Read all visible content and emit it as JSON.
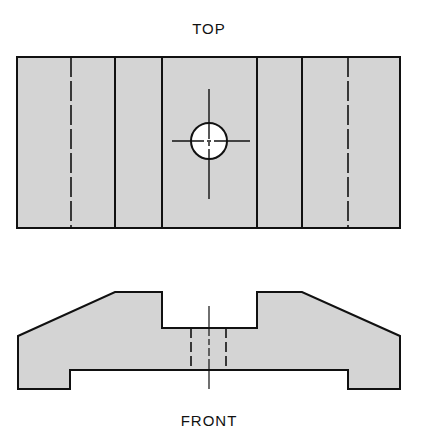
{
  "views": {
    "top": {
      "label": "TOP"
    },
    "front": {
      "label": "FRONT"
    }
  },
  "colors": {
    "fill": "#d4d4d4",
    "stroke": "#111111",
    "hole_fill": "#ffffff",
    "background": "#ffffff"
  },
  "geometry": {
    "top_view": {
      "outline": {
        "x": 17,
        "y": 57,
        "width": 383,
        "height": 171
      },
      "solid_lines_x": [
        115,
        162,
        257,
        302
      ],
      "hidden_lines_x": [
        71,
        348
      ],
      "hole": {
        "cx": 209,
        "cy": 141,
        "r": 18
      },
      "centerline_vertical": {
        "x": 209,
        "y1": 89,
        "y2": 199
      },
      "centerline_horizontal": {
        "y": 141,
        "x1": 172,
        "x2": 250
      }
    },
    "front_view": {
      "outline_points": "18,336 115,292 162,292 162,328 257,328 257,292 302,292 400,336 400,389 348,389 348,370 70,370 70,389 18,389",
      "hidden_lines_x": [
        191,
        226
      ],
      "hidden_y1": 328,
      "hidden_y2": 370,
      "centerline": {
        "x": 209,
        "y1": 306,
        "y2": 389
      }
    }
  }
}
